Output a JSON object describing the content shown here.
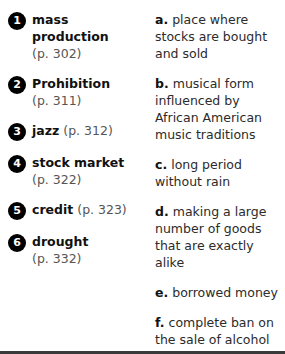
{
  "exercise": {
    "terms": [
      {
        "number": "1",
        "word": "mass production",
        "page": "(p. 302)",
        "layout": "stacked"
      },
      {
        "number": "2",
        "word": "Prohibition",
        "page": "(p. 311)",
        "layout": "stacked"
      },
      {
        "number": "3",
        "word": "jazz",
        "page": "(p. 312)",
        "layout": "inline"
      },
      {
        "number": "4",
        "word": "stock market",
        "page": "(p. 322)",
        "layout": "stacked"
      },
      {
        "number": "5",
        "word": "credit",
        "page": "(p. 323)",
        "layout": "inline"
      },
      {
        "number": "6",
        "word": "drought",
        "page": "(p. 332)",
        "layout": "stacked"
      }
    ],
    "definitions": [
      {
        "letter": "a.",
        "text": "place where stocks are bought and sold"
      },
      {
        "letter": "b.",
        "text": "musical form influenced by African American music traditions"
      },
      {
        "letter": "c.",
        "text": "long period without rain"
      },
      {
        "letter": "d.",
        "text": "making a large number of goods that are exactly alike"
      },
      {
        "letter": "e.",
        "text": "borrowed money"
      },
      {
        "letter": "f.",
        "text": "complete ban on the sale of alcohol"
      }
    ]
  },
  "colors": {
    "badge_fill": "#000000",
    "badge_text": "#ffffff",
    "term_word": "#111111",
    "page_ref": "#555555",
    "definition_text": "#2b2b2b",
    "bottom_rule": "#3a3a3a",
    "background": "#ffffff"
  }
}
